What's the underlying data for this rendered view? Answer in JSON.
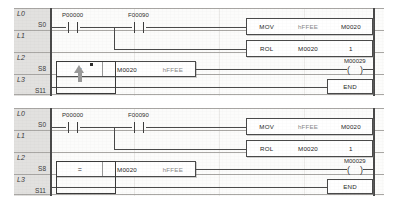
{
  "editor": {
    "type": "plc-ladder-logic",
    "panel_count": 2
  },
  "rows": {
    "labels": [
      "L0",
      "L1",
      "L2",
      "L3",
      "L4"
    ],
    "steps": [
      "S0",
      "S8",
      "S11"
    ],
    "step_row0": "S0",
    "step_row2": "S8",
    "step_row3": "S11"
  },
  "rung": {
    "contacts": [
      {
        "name": "P00000",
        "type": "normally-open"
      },
      {
        "name": "F00090",
        "type": "normally-open"
      }
    ],
    "mov": {
      "opcode": "MOV",
      "operand1": "hFFEE",
      "operand2": "M0020"
    },
    "rol": {
      "opcode": "ROL",
      "operand1": "M0020",
      "operand2": "1"
    },
    "compare": {
      "operator": "=",
      "operand1": "M0020",
      "operand2": "hFFEE"
    },
    "coil": {
      "name": "M00029",
      "symbol": "( )"
    },
    "end": {
      "label": "END"
    }
  },
  "panel_top": {
    "cursor_visible": true,
    "selection_visible": true
  },
  "panel_bottom": {
    "cursor_visible": false,
    "selection_visible": true
  },
  "colors": {
    "rail": "#4a4a4a",
    "gutter": "#e2e1df",
    "text": "#1f1f1f",
    "dim_text": "#8a8a8a",
    "cursor": "#9a9a9a"
  }
}
